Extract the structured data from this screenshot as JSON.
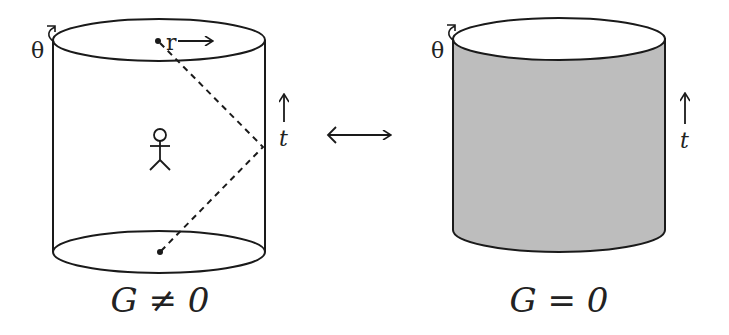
{
  "diagram": {
    "left_panel": {
      "caption": "G ≠ 0",
      "angle_label": "θ",
      "radius_label": "r",
      "time_label": "t",
      "fill_color": "#ffffff",
      "contents": [
        "stick-figure observer",
        "dashed light ray from top center to boundary and back to bottom center"
      ]
    },
    "right_panel": {
      "caption": "G = 0",
      "angle_label": "θ",
      "time_label": "t",
      "fill_color": "#bdbdbd"
    },
    "relation_symbol": "⟷",
    "stroke_color": "#1a1a1a"
  }
}
